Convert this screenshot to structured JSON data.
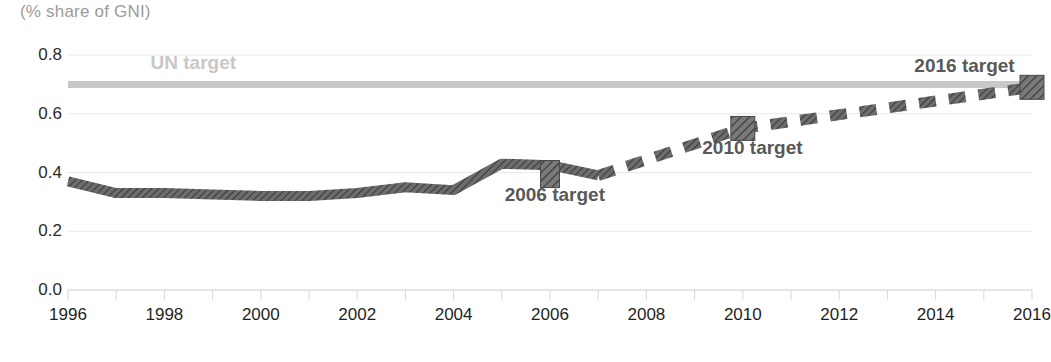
{
  "chart_data": {
    "type": "line",
    "title": "(% share of GNI)",
    "xlabel": "",
    "ylabel": "",
    "xlim": [
      1996,
      2016
    ],
    "ylim": [
      0.0,
      0.8
    ],
    "grid": true,
    "legend": "none",
    "y_ticks": [
      "0.8",
      "0.6",
      "0.4",
      "0.2",
      "0.0"
    ],
    "y_tick_values": [
      0.8,
      0.6,
      0.4,
      0.2,
      0.0
    ],
    "x_ticks": [
      "1996",
      "1998",
      "2000",
      "2002",
      "2004",
      "2006",
      "2008",
      "2010",
      "2012",
      "2014",
      "2016"
    ],
    "x_tick_values": [
      1996,
      1998,
      2000,
      2002,
      2004,
      2006,
      2008,
      2010,
      2012,
      2014,
      2016
    ],
    "x_minor_ticks": [
      1996,
      1997,
      1998,
      1999,
      2000,
      2001,
      2002,
      2003,
      2004,
      2005,
      2006,
      2007,
      2008,
      2009,
      2010,
      2011,
      2012,
      2013,
      2014,
      2015,
      2016
    ],
    "series": [
      {
        "name": "Actual ODA (% share of GNI)",
        "style": "solid",
        "color": "#5b5b5b",
        "x": [
          1996,
          1997,
          1998,
          1999,
          2000,
          2001,
          2002,
          2003,
          2004,
          2005,
          2006,
          2007
        ],
        "values": [
          0.37,
          0.33,
          0.33,
          0.325,
          0.32,
          0.32,
          0.33,
          0.35,
          0.34,
          0.43,
          0.425,
          0.39
        ]
      },
      {
        "name": "Projected ODA path to target",
        "style": "dashed",
        "color": "#5b5b5b",
        "x": [
          2007,
          2010,
          2016
        ],
        "values": [
          0.39,
          0.55,
          0.69
        ]
      },
      {
        "name": "UN target",
        "style": "solid-thick",
        "color": "#c8c8c8",
        "x": [
          1996,
          2016
        ],
        "values": [
          0.7,
          0.7
        ]
      }
    ],
    "markers": [
      {
        "name": "2006 target",
        "shape": "vertical-bar",
        "x": 2006,
        "value": 0.41,
        "color": "#5b5b5b"
      },
      {
        "name": "2010 target",
        "shape": "square",
        "x": 2010,
        "value": 0.55,
        "color": "#5b5b5b"
      },
      {
        "name": "2016 target",
        "shape": "square",
        "x": 2016,
        "value": 0.69,
        "color": "#5b5b5b"
      }
    ],
    "annotations": [
      {
        "text": "UN target",
        "x": 1998.6,
        "value": 0.765,
        "color": "#c8c8c8"
      },
      {
        "text": "2006 target",
        "x": 2006.1,
        "value": 0.315,
        "color": "#595959"
      },
      {
        "text": "2010 target",
        "x": 2010.2,
        "value": 0.475,
        "color": "#595959"
      },
      {
        "text": "2016 target",
        "x": 2014.6,
        "value": 0.755,
        "color": "#595959"
      }
    ],
    "colors": {
      "line": "#5b5b5b",
      "un_target": "#c8c8c8",
      "grid": "#e8e8e8",
      "axis_text": "#1f1f1f",
      "title_text": "#9b9b9b",
      "annotation_dark": "#595959",
      "background": "#ffffff"
    }
  }
}
